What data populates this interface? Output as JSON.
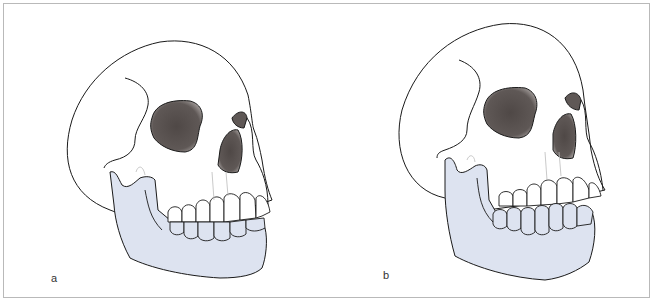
{
  "figure": {
    "panels": [
      {
        "label": "a",
        "description": "Skull, lateral-oblique view, jaw in occlusion (mandible shaded)"
      },
      {
        "label": "b",
        "description": "Skull, lateral-oblique view, mandible displaced forward/open (mandible shaded)"
      }
    ],
    "colors": {
      "mandible_fill": "#dde3f0",
      "orbit_fill": "#5f5856",
      "outline": "#1a1a1a",
      "frame_border": "#b9b9b9"
    }
  }
}
